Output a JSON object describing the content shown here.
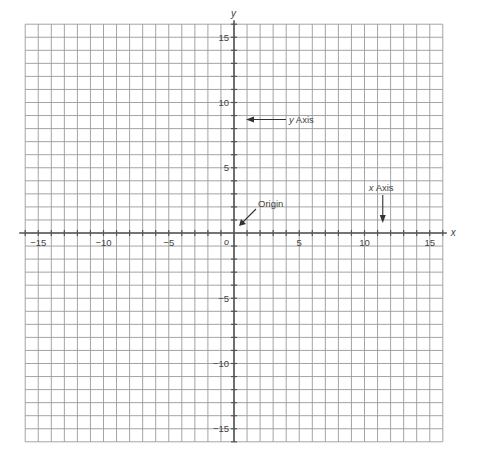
{
  "diagram": {
    "type": "coordinate-plane",
    "x_range": [
      -16,
      16
    ],
    "y_range": [
      -16,
      16
    ],
    "grid_step": 1,
    "tick_step": 1,
    "label_step": 5,
    "axis_labels": {
      "x": "x",
      "y": "y"
    },
    "origin_label": "o",
    "x_tick_labels": [
      "-15",
      "-10",
      "-5",
      "5",
      "10",
      "15"
    ],
    "x_tick_values": [
      -15,
      -10,
      -5,
      5,
      10,
      15
    ],
    "y_tick_labels": [
      "15",
      "10",
      "5",
      "-5",
      "-10",
      "-15"
    ],
    "y_tick_values": [
      15,
      10,
      5,
      -5,
      -10,
      -15
    ],
    "annotations": [
      {
        "text": "y Axis",
        "target": "y-axis",
        "arrow_direction": "left"
      },
      {
        "text": "Origin",
        "target": "origin",
        "arrow_direction": "down-left"
      },
      {
        "text": "x Axis",
        "target": "x-axis",
        "arrow_direction": "down"
      }
    ],
    "colors": {
      "grid": "#9a9a9a",
      "axis": "#555555",
      "text": "#444444",
      "background": "#ffffff"
    }
  }
}
